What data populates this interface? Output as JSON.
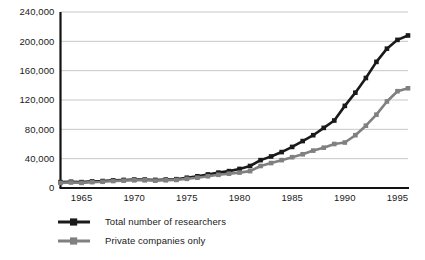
{
  "chart_data": {
    "type": "line",
    "title": "",
    "subtitle": "",
    "xlabel": "",
    "ylabel": "",
    "xlim": [
      1963,
      1996
    ],
    "ylim": [
      0,
      240000
    ],
    "grid": true,
    "legend_position": "bottom-left",
    "y_ticks": [
      0,
      40000,
      80000,
      120000,
      160000,
      200000,
      240000
    ],
    "y_tick_labels": [
      "0",
      "40,000",
      "80,000",
      "120,000",
      "160,000",
      "200,000",
      "240,000"
    ],
    "x_ticks": [
      1965,
      1970,
      1975,
      1980,
      1985,
      1990,
      1995
    ],
    "x_tick_labels": [
      "1965",
      "1970",
      "1975",
      "1980",
      "1985",
      "1990",
      "1995"
    ],
    "x": [
      1963,
      1964,
      1965,
      1966,
      1967,
      1968,
      1969,
      1970,
      1971,
      1972,
      1973,
      1974,
      1975,
      1976,
      1977,
      1978,
      1979,
      1980,
      1981,
      1982,
      1983,
      1984,
      1985,
      1986,
      1987,
      1988,
      1989,
      1990,
      1991,
      1992,
      1993,
      1994,
      1995,
      1996
    ],
    "series": [
      {
        "name": "Total number of researchers",
        "color": "#1a1a1a",
        "values": [
          8000,
          8500,
          8000,
          9000,
          9500,
          10500,
          11000,
          11500,
          11500,
          11000,
          11500,
          12000,
          14000,
          16000,
          18500,
          21000,
          23000,
          26000,
          30000,
          38000,
          43000,
          49000,
          56000,
          64000,
          72000,
          82000,
          92000,
          112000,
          130000,
          150000,
          172000,
          190000,
          202000,
          208000
        ]
      },
      {
        "name": "Private companies only",
        "color": "#808080",
        "values": [
          7000,
          7500,
          7000,
          8000,
          8500,
          9500,
          10000,
          10500,
          10500,
          10000,
          10500,
          11000,
          12500,
          14000,
          16000,
          18000,
          19500,
          21000,
          23000,
          30000,
          34000,
          38000,
          42000,
          46000,
          51000,
          55000,
          60000,
          62000,
          72000,
          85000,
          100000,
          118000,
          132000,
          136000
        ]
      }
    ]
  },
  "legend": {
    "items": [
      {
        "label": "Total number of researchers",
        "color": "#1a1a1a"
      },
      {
        "label": "Private companies only",
        "color": "#808080"
      }
    ]
  }
}
